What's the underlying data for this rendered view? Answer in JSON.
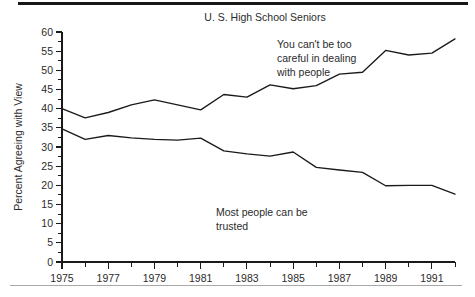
{
  "figure": {
    "title": "U. S. High School Seniors",
    "accent_color": "#1b1b1b",
    "background_color": "#ffffff",
    "rule_color_top": "#171717",
    "rule_color_bottom": "#a9a9a9"
  },
  "annotations": {
    "upper": {
      "line1": "You can't be too",
      "line2": "careful in dealing",
      "line3": "with people"
    },
    "lower": {
      "line1": "Most people can be",
      "line2": "trusted"
    }
  },
  "chart_data": {
    "type": "line",
    "title": "U. S. High School Seniors",
    "xlabel": "",
    "ylabel": "Percent Agreeing with View",
    "xlim": [
      1975,
      1992
    ],
    "ylim": [
      0,
      60
    ],
    "grid": false,
    "legend": "annotations-inline",
    "ytick_labels": [
      "0",
      "5",
      "10",
      "15",
      "20",
      "25",
      "30",
      "35",
      "40",
      "45",
      "50",
      "55",
      "60"
    ],
    "ytick_values": [
      0,
      5,
      10,
      15,
      20,
      25,
      30,
      35,
      40,
      45,
      50,
      55,
      60
    ],
    "xtick_values": [
      1975,
      1976,
      1977,
      1978,
      1979,
      1980,
      1981,
      1982,
      1983,
      1984,
      1985,
      1986,
      1987,
      1988,
      1989,
      1990,
      1991,
      1992
    ],
    "xtick_labels": [
      "1975",
      "",
      "1977",
      "",
      "1979",
      "",
      "1981",
      "",
      "1983",
      "",
      "1985",
      "",
      "1987",
      "",
      "1989",
      "",
      "1991",
      ""
    ],
    "x": [
      1975,
      1976,
      1977,
      1978,
      1979,
      1980,
      1981,
      1982,
      1983,
      1984,
      1985,
      1986,
      1987,
      1988,
      1989,
      1990,
      1991,
      1992
    ],
    "series": [
      {
        "name": "You can't be too careful in dealing with people",
        "values": [
          40.0,
          37.6,
          39.0,
          41.0,
          42.3,
          41.0,
          39.7,
          43.7,
          43.0,
          46.2,
          45.2,
          46.0,
          49.0,
          49.5,
          55.2,
          54.0,
          54.5,
          58.2
        ]
      },
      {
        "name": "Most people can be trusted",
        "values": [
          34.7,
          32.0,
          33.0,
          32.4,
          32.0,
          31.8,
          32.3,
          29.0,
          28.2,
          27.6,
          28.7,
          24.7,
          24.0,
          23.4,
          19.9,
          20.0,
          20.0,
          17.7
        ]
      }
    ]
  }
}
